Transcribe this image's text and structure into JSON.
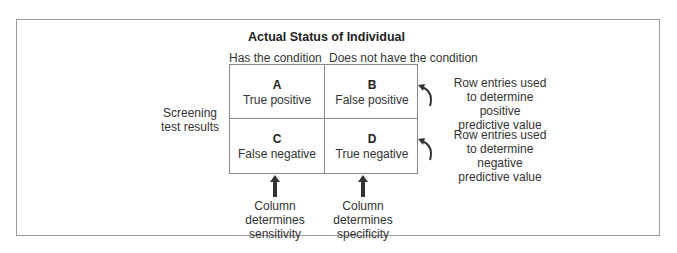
{
  "diagram": {
    "title": "Actual Status of Individual",
    "column_headers": [
      "Has the condition",
      "Does not have the condition"
    ],
    "row_label": [
      "Screening",
      "test results"
    ],
    "cells": [
      {
        "letter": "A",
        "label": "True positive"
      },
      {
        "letter": "B",
        "label": "False positive"
      },
      {
        "letter": "C",
        "label": "False negative"
      },
      {
        "letter": "D",
        "label": "True negative"
      }
    ],
    "row_notes": [
      [
        "Row entries used",
        "to determine",
        "positive",
        "predictive value"
      ],
      [
        "Row entries used",
        "to determine",
        "negative",
        "predictive value"
      ]
    ],
    "column_notes": [
      [
        "Column determines",
        "sensitivity"
      ],
      [
        "Column determines",
        "specificity"
      ]
    ],
    "icons": {
      "row_arrow": "curved-arrow-icon",
      "column_arrow": "up-arrow-icon"
    },
    "colors": {
      "border": "#888888",
      "frame": "#9a9a9a",
      "text": "#333333",
      "arrow": "#333333"
    }
  }
}
